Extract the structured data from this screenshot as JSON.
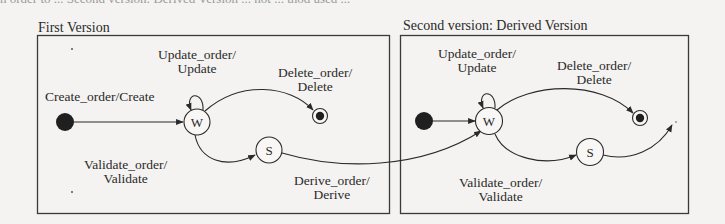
{
  "page": {
    "top_cut_text": "n order to ... Second version: Derived Version ... not ... thod used ..."
  },
  "panels": [
    {
      "id": "first",
      "title": "First Version",
      "states": [
        {
          "id": "initial",
          "kind": "initial"
        },
        {
          "id": "W",
          "label": "W",
          "kind": "state"
        },
        {
          "id": "S",
          "label": "S",
          "kind": "state"
        },
        {
          "id": "final",
          "kind": "final"
        }
      ],
      "transitions": [
        {
          "from": "initial",
          "to": "W",
          "line1": "Create_order/Create",
          "line2": ""
        },
        {
          "from": "W",
          "to": "W",
          "line1": "Update_order/",
          "line2": "Update"
        },
        {
          "from": "W",
          "to": "final",
          "line1": "Delete_order/",
          "line2": "Delete"
        },
        {
          "from": "W",
          "to": "S",
          "line1": "Validate_order/",
          "line2": "Validate"
        },
        {
          "from": "S",
          "to": "second.W",
          "line1": "Derive_order/",
          "line2": "Derive"
        }
      ]
    },
    {
      "id": "second",
      "title": "Second version: Derived  Version",
      "states": [
        {
          "id": "initial",
          "kind": "initial"
        },
        {
          "id": "W",
          "label": "W",
          "kind": "state"
        },
        {
          "id": "S",
          "label": "S",
          "kind": "state"
        },
        {
          "id": "final",
          "kind": "final"
        }
      ],
      "transitions": [
        {
          "from": "initial",
          "to": "W",
          "line1": "",
          "line2": ""
        },
        {
          "from": "W",
          "to": "W",
          "line1": "Update_order/",
          "line2": "Update"
        },
        {
          "from": "W",
          "to": "final",
          "line1": "Delete_order/",
          "line2": "Delete"
        },
        {
          "from": "W",
          "to": "S",
          "line1": "Validate_order/",
          "line2": "Validate"
        },
        {
          "from": "S",
          "to": "next",
          "line1": "",
          "line2": ""
        }
      ]
    }
  ],
  "colors": {
    "ink": "#2a2a2a",
    "background": "#f4f3f1",
    "border": "#3a3a3a"
  }
}
